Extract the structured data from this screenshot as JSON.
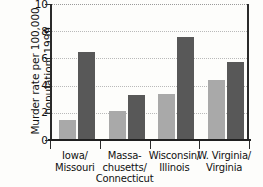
{
  "chart_data": {
    "type": "bar",
    "title": "Murder rates in adjacent states",
    "ylabel": "Murder rate per 100,000\npopulation, 1999",
    "xlabel": "",
    "ylim": [
      0,
      10
    ],
    "yticks": [
      0,
      2,
      4,
      6,
      8,
      10
    ],
    "ytick_labels": [
      "0",
      "2",
      "4",
      "6",
      "8",
      "10"
    ],
    "grid": true,
    "grid_axis": "y",
    "legend": "none",
    "categories": [
      "Iowa/\nMissouri",
      "Massa-\nchusetts/\nConnecticut",
      "Wisconsin/\nIllinois",
      "W. Virginia/\nVirginia"
    ],
    "series": [
      {
        "name": "Low-rate state",
        "color": "#a9a9a9",
        "values": [
          1.5,
          2.1,
          3.4,
          4.4
        ]
      },
      {
        "name": "High-rate state",
        "color": "#585858",
        "values": [
          6.5,
          3.3,
          7.6,
          5.7
        ]
      }
    ],
    "pairs": [
      {
        "category": "Iowa/\nMissouri",
        "low": 1.5,
        "high": 6.5
      },
      {
        "category": "Massa-\nchusetts/\nConnecticut",
        "low": 2.1,
        "high": 3.3
      },
      {
        "category": "Wisconsin/\nIllinois",
        "low": 3.4,
        "high": 7.6
      },
      {
        "category": "W. Virginia/\nVirginia",
        "low": 4.4,
        "high": 5.7
      }
    ]
  },
  "colors": {
    "bar_light": "#a9a9a9",
    "bar_dark": "#585858",
    "axis": "#2a2a2a",
    "gridline": "#b9b9b9",
    "background": "#fdfdfb",
    "text": "#111111"
  }
}
